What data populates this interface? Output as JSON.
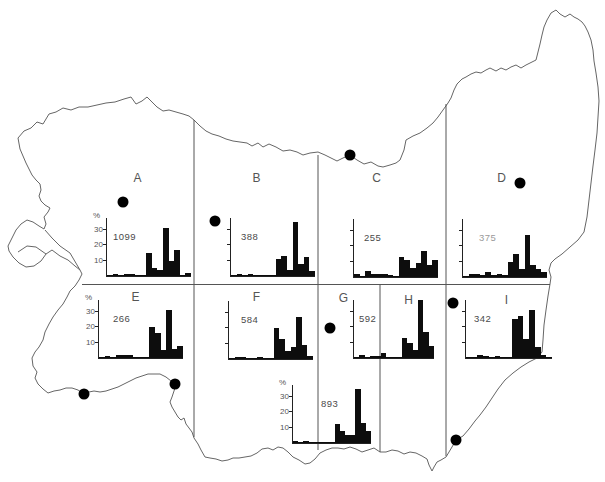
{
  "figure_type": "map with regional histograms",
  "axis": {
    "ylabel": "%",
    "yticks": [
      10,
      20,
      30
    ],
    "px_per_percent": 1.55
  },
  "regions": [
    {
      "id": "A",
      "label": "A",
      "x": 138,
      "y": 178
    },
    {
      "id": "B",
      "label": "B",
      "x": 257,
      "y": 178
    },
    {
      "id": "C",
      "label": "C",
      "x": 377,
      "y": 178
    },
    {
      "id": "D",
      "label": "D",
      "x": 502,
      "y": 178
    },
    {
      "id": "E",
      "label": "E",
      "x": 136,
      "y": 297
    },
    {
      "id": "F",
      "label": "F",
      "x": 257,
      "y": 297
    },
    {
      "id": "G",
      "label": "G",
      "x": 344,
      "y": 298
    },
    {
      "id": "H",
      "label": "H",
      "x": 409,
      "y": 300
    },
    {
      "id": "I",
      "label": "I",
      "x": 507,
      "y": 300
    }
  ],
  "map": {
    "outline_color": "#666666",
    "divider_color": "#555555",
    "dot_color": "#000000",
    "dot_radius": 5.5,
    "dividers_v": [
      {
        "x": 194,
        "y1": 120,
        "y2": 437
      },
      {
        "x": 318,
        "y1": 155,
        "y2": 450
      },
      {
        "x": 380,
        "y1": 284,
        "y2": 452
      },
      {
        "x": 446,
        "y1": 104,
        "y2": 456
      }
    ],
    "dividers_h": [
      {
        "y": 284.5,
        "x1": 82,
        "x2": 550
      }
    ],
    "dots": [
      {
        "x": 123,
        "y": 202
      },
      {
        "x": 215,
        "y": 221
      },
      {
        "x": 350,
        "y": 155
      },
      {
        "x": 520,
        "y": 183
      },
      {
        "x": 330,
        "y": 328
      },
      {
        "x": 453,
        "y": 303
      },
      {
        "x": 84,
        "y": 394
      },
      {
        "x": 175,
        "y": 384
      },
      {
        "x": 456,
        "y": 440
      }
    ]
  },
  "chart_data": [
    {
      "type": "bar",
      "region": "A",
      "count": "1099",
      "n": 1099,
      "ylabel": "%",
      "yticks": [
        10,
        20,
        30
      ],
      "axis_labeled": true,
      "count_faded": false,
      "values": [
        0.5,
        1.5,
        0.5,
        1,
        1,
        0.5,
        0.5,
        15,
        5,
        4,
        31,
        10,
        17,
        0.5,
        2
      ],
      "layout": {
        "x": 106,
        "baseline_y": 276,
        "width": 84,
        "height": 58,
        "count_dx": 6
      }
    },
    {
      "type": "bar",
      "region": "B",
      "count": "388",
      "n": 388,
      "ylabel": "%",
      "yticks": [
        10,
        20,
        30
      ],
      "axis_labeled": false,
      "count_faded": false,
      "values": [
        0.5,
        1.5,
        0.5,
        1,
        0.5,
        0.5,
        0.5,
        0.5,
        11,
        13,
        4,
        35,
        8,
        12,
        3
      ],
      "layout": {
        "x": 230,
        "baseline_y": 276,
        "width": 84,
        "height": 58,
        "count_dx": 10
      }
    },
    {
      "type": "bar",
      "region": "C",
      "count": "255",
      "n": 255,
      "ylabel": "%",
      "yticks": [
        10,
        20,
        30
      ],
      "axis_labeled": false,
      "count_faded": false,
      "values": [
        2,
        0.5,
        4,
        2,
        2,
        2,
        1,
        0.5,
        13,
        11,
        6,
        9,
        17,
        8,
        11
      ],
      "layout": {
        "x": 353,
        "baseline_y": 277,
        "width": 84,
        "height": 58,
        "count_dx": 10
      }
    },
    {
      "type": "bar",
      "region": "D",
      "count": "375",
      "n": 375,
      "ylabel": "%",
      "yticks": [
        10,
        20,
        30
      ],
      "axis_labeled": false,
      "count_faded": true,
      "values": [
        0.5,
        2,
        2,
        1,
        3,
        1.5,
        2,
        1,
        10,
        15,
        5,
        27,
        8,
        5,
        3
      ],
      "layout": {
        "x": 462,
        "baseline_y": 277,
        "width": 84,
        "height": 58,
        "count_dx": 16
      }
    },
    {
      "type": "bar",
      "region": "E",
      "count": "266",
      "n": 266,
      "ylabel": "%",
      "yticks": [
        10,
        20,
        30
      ],
      "axis_labeled": true,
      "count_faded": false,
      "values": [
        0.5,
        1.5,
        0.5,
        2,
        2,
        2,
        0.5,
        0.5,
        0.5,
        20,
        16,
        5,
        31,
        6,
        8
      ],
      "layout": {
        "x": 98,
        "baseline_y": 358,
        "width": 84,
        "height": 58,
        "count_dx": 14
      }
    },
    {
      "type": "bar",
      "region": "F",
      "count": "584",
      "n": 584,
      "ylabel": "%",
      "yticks": [
        10,
        20,
        30
      ],
      "axis_labeled": false,
      "count_faded": false,
      "values": [
        0.5,
        1.5,
        1.5,
        0.5,
        0.5,
        1,
        0.5,
        0.5,
        20,
        13,
        5,
        8,
        27,
        9,
        2
      ],
      "layout": {
        "x": 228,
        "baseline_y": 359,
        "width": 84,
        "height": 58,
        "count_dx": 12
      }
    },
    {
      "type": "bar",
      "region": "G",
      "count": "893",
      "n": 893,
      "ylabel": "%",
      "yticks": [
        10,
        20,
        30
      ],
      "axis_labeled": true,
      "count_faded": false,
      "values": [
        1,
        0.5,
        1.5,
        0.5,
        0.5,
        0.5,
        0.5,
        0.5,
        12,
        8,
        5,
        5,
        35,
        13,
        8
      ],
      "layout": {
        "x": 292,
        "baseline_y": 443,
        "width": 78,
        "height": 58,
        "count_dx": 28
      }
    },
    {
      "type": "bar",
      "region": "H",
      "count": "592",
      "n": 592,
      "ylabel": "%",
      "yticks": [
        10,
        20,
        30
      ],
      "axis_labeled": false,
      "count_faded": false,
      "values": [
        0.5,
        2,
        0.5,
        1,
        1,
        3,
        0.5,
        0.5,
        0.5,
        13,
        10,
        5,
        38,
        17,
        8
      ],
      "layout": {
        "x": 353,
        "baseline_y": 358,
        "width": 80,
        "height": 58,
        "count_dx": 5
      }
    },
    {
      "type": "bar",
      "region": "I",
      "count": "342",
      "n": 342,
      "ylabel": "%",
      "yticks": [
        10,
        20,
        30
      ],
      "axis_labeled": false,
      "count_faded": false,
      "values": [
        0.5,
        0.5,
        2,
        1,
        0.5,
        1,
        0.5,
        0.5,
        25,
        27,
        12,
        31,
        7,
        2,
        0.5
      ],
      "layout": {
        "x": 465,
        "baseline_y": 358,
        "width": 86,
        "height": 58,
        "count_dx": 8
      }
    }
  ]
}
